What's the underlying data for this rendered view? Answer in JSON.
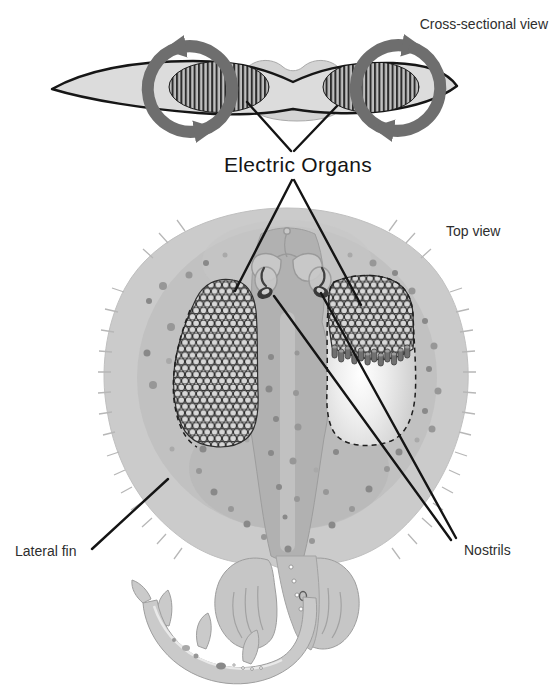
{
  "figure": {
    "labels": {
      "cross_section_view": "Cross-sectional view",
      "electric_organs": "Electric Organs",
      "top_view": "Top view",
      "lateral_fin": "Lateral fin",
      "nostrils": "Nostrils"
    },
    "colors": {
      "background": "#ffffff",
      "body_gray": "#cbcbcb",
      "arrow_gray": "#6e6e6e",
      "line_black": "#141414",
      "label_text": "#2e2e2e"
    }
  }
}
